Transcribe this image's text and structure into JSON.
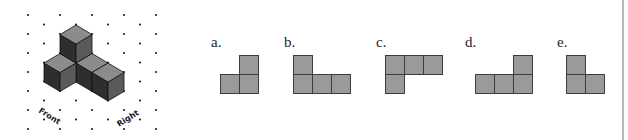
{
  "figure": {
    "type": "isometric-cube-structure",
    "grid": {
      "origin_x": 28,
      "origin_y": 15,
      "col_spacing": 16,
      "row_spacing": 19,
      "cols": 9,
      "rows": 7,
      "dot_color": "#222222"
    },
    "iso": {
      "anchor_x": 76,
      "anchor_y": 25,
      "dx": 16,
      "dy": 9.5,
      "h": 19
    },
    "cubes": [
      {
        "i": 0,
        "j": 0,
        "k": 0
      },
      {
        "i": 1,
        "j": 0,
        "k": 0
      },
      {
        "i": 2,
        "j": 0,
        "k": 0
      },
      {
        "i": 0,
        "j": 1,
        "k": 0
      },
      {
        "i": 0,
        "j": 0,
        "k": 1
      }
    ],
    "face_colors": {
      "top": "#8c8c8c",
      "left": "#2e2e2e",
      "right": "#5a5a5a",
      "edge": "#111111"
    },
    "labels": {
      "front": "Front",
      "right": "Right"
    }
  },
  "options": [
    {
      "label": "a.",
      "left": 211,
      "cells": [
        [
          1,
          0
        ],
        [
          0,
          1
        ],
        [
          1,
          1
        ]
      ],
      "origin_x": 220
    },
    {
      "label": "b.",
      "left": 284,
      "cells": [
        [
          0,
          0
        ],
        [
          0,
          1
        ],
        [
          1,
          1
        ],
        [
          2,
          1
        ]
      ],
      "origin_x": 293
    },
    {
      "label": "c.",
      "left": 376,
      "cells": [
        [
          0,
          0
        ],
        [
          1,
          0
        ],
        [
          2,
          0
        ],
        [
          0,
          1
        ]
      ],
      "origin_x": 385
    },
    {
      "label": "d.",
      "left": 465,
      "cells": [
        [
          2,
          0
        ],
        [
          0,
          1
        ],
        [
          1,
          1
        ],
        [
          2,
          1
        ]
      ],
      "origin_x": 475
    },
    {
      "label": "e.",
      "left": 557,
      "cells": [
        [
          0,
          0
        ],
        [
          0,
          1
        ],
        [
          1,
          1
        ]
      ],
      "origin_x": 566
    }
  ],
  "square": {
    "size": 18,
    "origin_y": 55,
    "fill": "#9a9a9a",
    "stroke": "#3c3c3c"
  }
}
